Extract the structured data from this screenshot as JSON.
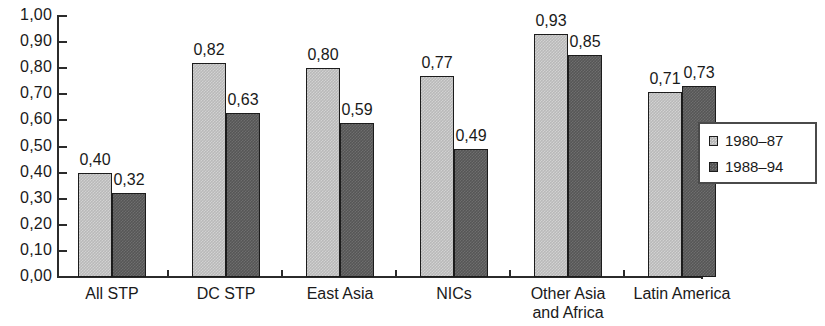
{
  "chart_data": {
    "type": "bar",
    "title": "",
    "subtitle": "",
    "xlabel": "",
    "ylabel": "",
    "ylim": [
      0,
      1.0
    ],
    "grid": false,
    "legend_position": "right",
    "decimal_separator": ",",
    "categories": [
      "All STP",
      "DC STP",
      "East Asia",
      "NICs",
      "Other Asia\nand Africa",
      "Latin America"
    ],
    "series": [
      {
        "name": "1980–87",
        "swatch": "light",
        "color": "#b9b9b9",
        "values": [
          0.4,
          0.82,
          0.8,
          0.77,
          0.93,
          0.71
        ],
        "labels": [
          "0,40",
          "0,82",
          "0,80",
          "0,77",
          "0,93",
          "0,71"
        ]
      },
      {
        "name": "1988–94",
        "swatch": "dark",
        "color": "#565656",
        "values": [
          0.32,
          0.63,
          0.59,
          0.49,
          0.85,
          0.73
        ],
        "labels": [
          "0,32",
          "0,63",
          "0,59",
          "0,49",
          "0,85",
          "0,73"
        ]
      }
    ],
    "yticks": [
      0.0,
      0.1,
      0.2,
      0.3,
      0.4,
      0.5,
      0.6,
      0.7,
      0.8,
      0.9,
      1.0
    ],
    "ytick_labels": [
      "0,00",
      "0,10",
      "0,20",
      "0,30",
      "0,40",
      "0,50",
      "0,60",
      "0,70",
      "0,80",
      "0,90",
      "1,00"
    ]
  },
  "legend": {
    "entries": [
      {
        "label": "1980–87"
      },
      {
        "label": "1988–94"
      }
    ]
  },
  "axis": {
    "y_tick_labels": [
      "1,00",
      "0,90",
      "0,80",
      "0,70",
      "0,60",
      "0,50",
      "0,40",
      "0,30",
      "0,20",
      "0,10",
      "0,00"
    ],
    "x_category_labels": [
      "All STP",
      "DC STP",
      "East Asia",
      "NICs",
      "Other Asia\nand Africa",
      "Latin America"
    ]
  },
  "bar_values": {
    "all_stp": {
      "light": "0,40",
      "dark": "0,32"
    },
    "dc_stp": {
      "light": "0,82",
      "dark": "0,63"
    },
    "east_asia": {
      "light": "0,80",
      "dark": "0,59"
    },
    "nics": {
      "light": "0,77",
      "dark": "0,49"
    },
    "other_asia_africa": {
      "light": "0,93",
      "dark": "0,85"
    },
    "latin_america": {
      "light": "0,71",
      "dark": "0,73"
    }
  },
  "colors": {
    "light_series": "#b9b9b9",
    "dark_series": "#565656",
    "axis": "#2b2b2b",
    "text": "#1a1a1a",
    "background": "#ffffff"
  }
}
